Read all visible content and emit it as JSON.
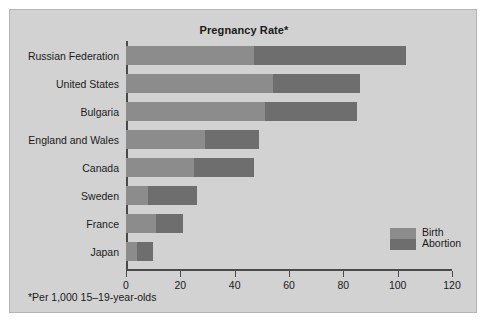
{
  "chart_data": {
    "type": "bar",
    "orientation": "horizontal",
    "stacked": true,
    "title": "Pregnancy Rate*",
    "footnote": "*Per 1,000 15–19-year-olds",
    "xlabel": "",
    "ylabel": "",
    "xlim": [
      0,
      120
    ],
    "xticks": [
      0,
      20,
      40,
      60,
      80,
      100,
      120
    ],
    "xtick_labels": [
      "0",
      "20",
      "40",
      "60",
      "80",
      "100",
      "120"
    ],
    "grid": false,
    "legend_position": "inside-lower-right",
    "categories": [
      "Russian Federation",
      "United States",
      "Bulgaria",
      "England and Wales",
      "Canada",
      "Sweden",
      "France",
      "Japan"
    ],
    "series": [
      {
        "name": "Birth",
        "color": "#8c8c8c",
        "values": [
          47,
          54,
          51,
          29,
          25,
          8,
          11,
          4
        ]
      },
      {
        "name": "Abortion",
        "color": "#6e6e6e",
        "values": [
          56,
          32,
          34,
          20,
          22,
          18,
          10,
          6
        ]
      }
    ],
    "totals": [
      103,
      86,
      85,
      49,
      47,
      26,
      21,
      10
    ]
  },
  "legend": {
    "items": [
      {
        "label": "Birth",
        "color": "#8c8c8c"
      },
      {
        "label": "Abortion",
        "color": "#6e6e6e"
      }
    ]
  },
  "colors": {
    "panel_background": "#d2d2d2",
    "axis": "#4a4a4a",
    "text": "#1a1a1a",
    "birth": "#8c8c8c",
    "abortion": "#6e6e6e"
  }
}
